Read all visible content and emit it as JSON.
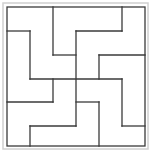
{
  "diagram": {
    "type": "tiling-puzzle",
    "grid": {
      "cols": 6,
      "rows": 6
    },
    "colors": {
      "background": "#ffffff",
      "outer_frame": "#d0d0d0",
      "lines": "#3a3a3a"
    },
    "outer_frame": {
      "x": 3,
      "y": 3,
      "w": 145,
      "h": 146
    },
    "border": {
      "x": 7,
      "y": 7,
      "w": 138,
      "h": 139
    },
    "segments": [
      {
        "x1": 53,
        "y1": 7,
        "x2": 53,
        "y2": 55
      },
      {
        "x1": 53,
        "y1": 55,
        "x2": 76,
        "y2": 55
      },
      {
        "x1": 76,
        "y1": 31,
        "x2": 76,
        "y2": 126
      },
      {
        "x1": 76,
        "y1": 31,
        "x2": 122,
        "y2": 31
      },
      {
        "x1": 122,
        "y1": 7,
        "x2": 122,
        "y2": 31
      },
      {
        "x1": 7,
        "y1": 31,
        "x2": 30,
        "y2": 31
      },
      {
        "x1": 30,
        "y1": 31,
        "x2": 30,
        "y2": 79
      },
      {
        "x1": 30,
        "y1": 79,
        "x2": 122,
        "y2": 79
      },
      {
        "x1": 99,
        "y1": 55,
        "x2": 145,
        "y2": 55
      },
      {
        "x1": 99,
        "y1": 55,
        "x2": 99,
        "y2": 79
      },
      {
        "x1": 53,
        "y1": 79,
        "x2": 53,
        "y2": 102
      },
      {
        "x1": 7,
        "y1": 102,
        "x2": 53,
        "y2": 102
      },
      {
        "x1": 76,
        "y1": 102,
        "x2": 99,
        "y2": 102
      },
      {
        "x1": 99,
        "y1": 102,
        "x2": 99,
        "y2": 146
      },
      {
        "x1": 122,
        "y1": 79,
        "x2": 122,
        "y2": 126
      },
      {
        "x1": 122,
        "y1": 126,
        "x2": 145,
        "y2": 126
      },
      {
        "x1": 30,
        "y1": 126,
        "x2": 76,
        "y2": 126
      },
      {
        "x1": 30,
        "y1": 126,
        "x2": 30,
        "y2": 146
      }
    ]
  }
}
